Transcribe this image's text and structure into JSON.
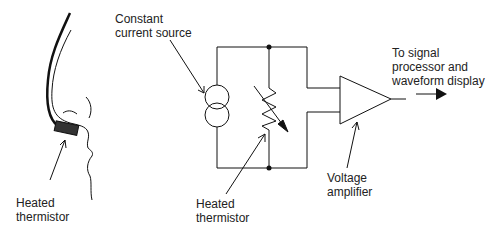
{
  "labels": {
    "nose_thermistor": "Heated\nthermistor",
    "current_source": "Constant\ncurrent source",
    "circuit_thermistor": "Heated\nthermistor",
    "amplifier": "Voltage\namplifier",
    "output": "To signal\nprocessor and\nwaveform display"
  },
  "colors": {
    "stroke": "#111111",
    "thermistor_body": "#333333",
    "background": "#ffffff"
  }
}
